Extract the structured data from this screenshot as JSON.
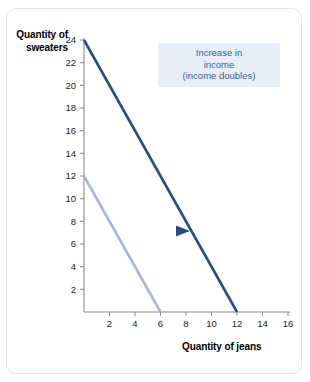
{
  "chart_data": {
    "type": "line",
    "title": "",
    "xlabel": "Quantity of jeans",
    "ylabel": "Quantity of sweaters",
    "xlim": [
      0,
      16
    ],
    "ylim": [
      0,
      24
    ],
    "xticks": [
      2,
      4,
      6,
      8,
      10,
      12,
      14,
      16
    ],
    "yticks": [
      2,
      4,
      6,
      8,
      10,
      12,
      14,
      16,
      18,
      20,
      22,
      24
    ],
    "grid": false,
    "legend": "none",
    "series": [
      {
        "name": "original-budget-constraint",
        "color": "#aab8d4",
        "x": [
          0,
          6
        ],
        "y": [
          12,
          0
        ],
        "note": "Original budget constraint: 12 sweaters or 6 jeans"
      },
      {
        "name": "new-budget-constraint",
        "color": "#2d4d7a",
        "x": [
          0,
          12
        ],
        "y": [
          24,
          0
        ],
        "note": "New budget constraint after income doubles: 24 sweaters or 12 jeans"
      }
    ],
    "annotations": [
      {
        "name": "income-increase-callout",
        "lines": [
          "Increase in",
          "income",
          "(income doubles)"
        ],
        "text_color": "#3a5f99",
        "background_color": "#e8eef7"
      },
      {
        "name": "shift-arrow",
        "kind": "arrow",
        "direction": "right",
        "from_color": "#eef2f8",
        "to_color": "#2d4d7a"
      }
    ]
  },
  "axes": {
    "y_title_line1": "Quantity of",
    "y_title_line2": "sweaters",
    "x_title": "Quantity of jeans",
    "axis_color": "#8a8a8a"
  },
  "annotation": {
    "line1": "Increase in",
    "line2": "income",
    "line3": "(income doubles)"
  }
}
